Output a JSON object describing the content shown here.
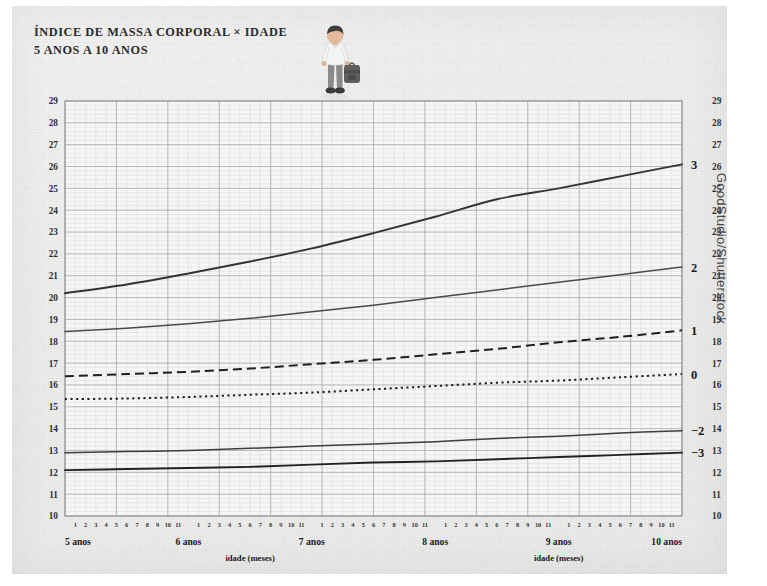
{
  "title": {
    "line1": "ÍNDICE DE MASSA CORPORAL × IDADE",
    "line2": "5 ANOS A 10 ANOS"
  },
  "credit": "GoodStudio/Shutterstock",
  "illustration": {
    "name": "child-with-backpack",
    "shirt_color": "#f2f2f2",
    "pants_color": "#8a8a8a",
    "hair_color": "#3a3a3a",
    "backpack_color": "#5b5b5b",
    "skin_color": "#d9b79a"
  },
  "chart_data": {
    "type": "line",
    "xlabel": "idade (meses)",
    "ylabel": "",
    "ylim": [
      10,
      29
    ],
    "xlim": [
      5,
      10
    ],
    "grid": true,
    "legend_position": "right-inline",
    "yticks": [
      10,
      11,
      12,
      13,
      14,
      15,
      16,
      17,
      18,
      19,
      20,
      21,
      22,
      23,
      24,
      25,
      26,
      27,
      28,
      29
    ],
    "year_ticks": [
      "5 anos",
      "6 anos",
      "7 anos",
      "8 anos",
      "9 anos",
      "10 anos"
    ],
    "month_ticks": [
      "1",
      "2",
      "3",
      "4",
      "5",
      "6",
      "7",
      "8",
      "9",
      "10",
      "11"
    ],
    "x_axis_title_left": "idade (meses)",
    "x_axis_title_right": "idade (meses)",
    "x": [
      5.0,
      5.5,
      6.0,
      6.5,
      7.0,
      7.5,
      8.0,
      8.5,
      9.0,
      9.5,
      10.0
    ],
    "series": [
      {
        "name": "3",
        "label": "3",
        "style": "solid",
        "color": "#333333",
        "width": 1.9,
        "values": [
          20.2,
          20.6,
          21.1,
          21.65,
          22.25,
          22.95,
          23.7,
          24.5,
          25.0,
          25.55,
          26.1
        ]
      },
      {
        "name": "2",
        "label": "2",
        "style": "solid",
        "color": "#4a4a4a",
        "width": 1.5,
        "values": [
          18.45,
          18.6,
          18.8,
          19.05,
          19.35,
          19.65,
          20.0,
          20.35,
          20.7,
          21.05,
          21.4
        ]
      },
      {
        "name": "1",
        "label": "1",
        "style": "dashed",
        "color": "#1f1f1f",
        "width": 2.0,
        "values": [
          16.4,
          16.5,
          16.6,
          16.75,
          16.95,
          17.15,
          17.4,
          17.65,
          17.95,
          18.2,
          18.5
        ]
      },
      {
        "name": "0",
        "label": "0",
        "style": "dotted",
        "color": "#1f1f1f",
        "width": 2.0,
        "values": [
          15.35,
          15.38,
          15.45,
          15.55,
          15.65,
          15.8,
          15.95,
          16.1,
          16.2,
          16.35,
          16.5
        ]
      },
      {
        "name": "-2",
        "label": "−2",
        "style": "solid",
        "color": "#3d3d3d",
        "width": 1.5,
        "values": [
          12.9,
          12.95,
          13.0,
          13.1,
          13.2,
          13.3,
          13.4,
          13.55,
          13.65,
          13.8,
          13.9
        ]
      },
      {
        "name": "-3",
        "label": "−3",
        "style": "solid",
        "color": "#222222",
        "width": 1.9,
        "values": [
          12.1,
          12.15,
          12.2,
          12.25,
          12.35,
          12.45,
          12.5,
          12.6,
          12.7,
          12.8,
          12.9
        ]
      }
    ]
  }
}
